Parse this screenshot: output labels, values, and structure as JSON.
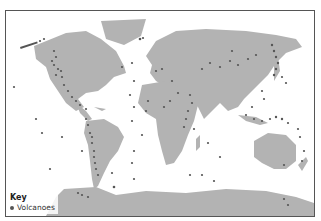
{
  "map": {
    "type": "world-volcano-distribution",
    "land_color": "#b3b3b3",
    "ocean_color": "#ffffff",
    "volcano_color": "#555555",
    "frame_color": "#555555"
  },
  "legend": {
    "title": "Key",
    "items": [
      {
        "label": "Volcanoes",
        "symbol": "circle",
        "color": "#555555"
      }
    ]
  }
}
